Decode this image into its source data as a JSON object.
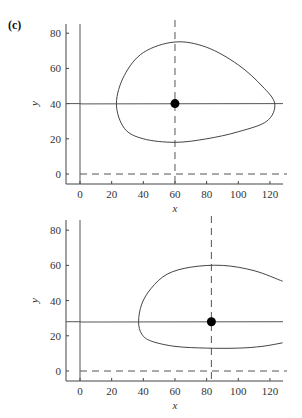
{
  "panel_label": "(c)",
  "chart_data": [
    {
      "type": "line",
      "title": "",
      "xlabel": "x",
      "ylabel": "y",
      "xlim": [
        -8,
        128
      ],
      "ylim": [
        -6,
        86
      ],
      "xticks": [
        0,
        20,
        40,
        60,
        80,
        100,
        120
      ],
      "yticks": [
        0,
        20,
        40,
        60,
        80
      ],
      "grid": false,
      "equilibrium": {
        "x": 60,
        "y": 40
      },
      "nullclines": {
        "y_nullcline_vertical_dashed": {
          "x": 60
        },
        "x_nullcline_horizontal_dashed": {
          "y": 0
        },
        "solid_horizontal": {
          "y": 40
        },
        "solid_vertical": {
          "x": 0
        }
      },
      "orbit": {
        "closed": true,
        "points": [
          [
            60,
            75
          ],
          [
            80,
            72
          ],
          [
            100,
            62
          ],
          [
            115,
            50
          ],
          [
            123,
            40
          ],
          [
            118,
            30
          ],
          [
            100,
            24
          ],
          [
            80,
            20
          ],
          [
            60,
            18
          ],
          [
            40,
            20
          ],
          [
            28,
            26
          ],
          [
            23,
            40
          ],
          [
            28,
            56
          ],
          [
            40,
            69
          ],
          [
            60,
            75
          ]
        ]
      }
    },
    {
      "type": "line",
      "title": "",
      "xlabel": "x",
      "ylabel": "y",
      "xlim": [
        -8,
        128
      ],
      "ylim": [
        -6,
        86
      ],
      "xticks": [
        0,
        20,
        40,
        60,
        80,
        100,
        120
      ],
      "yticks": [
        0,
        20,
        40,
        60,
        80
      ],
      "grid": false,
      "equilibrium": {
        "x": 83,
        "y": 28
      },
      "nullclines": {
        "y_nullcline_vertical_dashed": {
          "x": 83
        },
        "x_nullcline_horizontal_dashed": {
          "y": 0
        },
        "solid_horizontal": {
          "y": 28
        },
        "solid_vertical": {
          "x": 0
        }
      },
      "orbit": {
        "closed": false,
        "points": [
          [
            128,
            51
          ],
          [
            110,
            57
          ],
          [
            90,
            60
          ],
          [
            70,
            59
          ],
          [
            55,
            55
          ],
          [
            45,
            47
          ],
          [
            39,
            38
          ],
          [
            37,
            28
          ],
          [
            39,
            21
          ],
          [
            45,
            17
          ],
          [
            60,
            14
          ],
          [
            80,
            13
          ],
          [
            100,
            13
          ],
          [
            115,
            14
          ],
          [
            128,
            16
          ]
        ]
      }
    }
  ]
}
